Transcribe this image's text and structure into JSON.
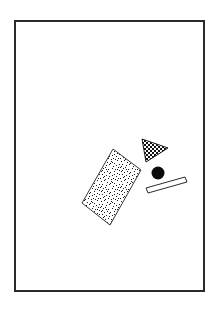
{
  "figure": {
    "title": "Abstract geometric shapes figure",
    "canvas": {
      "width": 218,
      "height": 310,
      "background_color": "#ffffff"
    },
    "frame": {
      "name": "rectangular-border",
      "x": 14,
      "y": 20,
      "width": 191,
      "height": 272,
      "stroke_color": "#2b2b2b",
      "stroke_width": 2,
      "fill_color": "#ffffff"
    },
    "shapes": [
      {
        "name": "speckled-rectangle",
        "type": "rectangle",
        "fill_pattern": "speckle",
        "fill_color": "#ffffff",
        "speckle_color": "#1a1a1a",
        "stroke_color": "#3a3a3a",
        "stroke_width": 1,
        "rotation_deg": -32,
        "points": "113,149 141,170 110,225 82,203",
        "center_x": 111,
        "center_y": 187
      },
      {
        "name": "checkered-triangle",
        "type": "triangle",
        "fill_pattern": "checkerboard",
        "fill_color": "#ffffff",
        "check_color": "#111111",
        "stroke_color": "#1a1a1a",
        "stroke_width": 1,
        "points": "142,139 168,148 146,162",
        "center_x": 152,
        "center_y": 150
      },
      {
        "name": "solid-circle",
        "type": "circle",
        "fill_pattern": "solid",
        "fill_color": "#0b0b0b",
        "stroke_color": "#0b0b0b",
        "stroke_width": 0,
        "center_x": 158,
        "center_y": 173,
        "radius": 6.5
      },
      {
        "name": "outlined-bar",
        "type": "parallelogram",
        "fill_pattern": "none",
        "fill_color": "#ffffff",
        "stroke_color": "#2b2b2b",
        "stroke_width": 1,
        "points": "146,188 185,177 187,182 148,193",
        "center_x": 166,
        "center_y": 185
      }
    ]
  }
}
